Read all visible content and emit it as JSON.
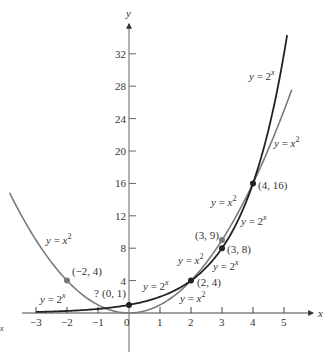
{
  "chart_data": {
    "type": "line",
    "title": "",
    "xlabel": "x",
    "ylabel": "y",
    "xlim": [
      -3.3,
      6.2
    ],
    "ylim": [
      -4,
      37
    ],
    "grid": false,
    "x_ticks": [
      -3,
      -2,
      -1,
      0,
      1,
      2,
      3,
      4,
      5
    ],
    "x_tick_labels": [
      "−3",
      "−2",
      "−1",
      "0",
      "1",
      "2",
      "3",
      "4",
      "5"
    ],
    "y_ticks": [
      4,
      8,
      12,
      16,
      20,
      24,
      28,
      32
    ],
    "y_tick_labels": [
      "4",
      "8",
      "12",
      "16",
      "20",
      "24",
      "28",
      "32"
    ],
    "series": [
      {
        "name": "y = 2^x",
        "label": "y = 2x",
        "function": "2^x",
        "domain": [
          -3,
          5.1
        ],
        "color": "#2a2a2a",
        "x": [
          -3,
          -2,
          -1,
          0,
          1,
          2,
          3,
          4,
          5
        ],
        "values": [
          0.125,
          0.25,
          0.5,
          1,
          2,
          4,
          8,
          16,
          32
        ]
      },
      {
        "name": "y = x^2",
        "label": "y = x2",
        "function": "x^2",
        "domain": [
          -3.85,
          5.25
        ],
        "color": "#7a7a7a",
        "x": [
          -3,
          -2,
          -1,
          0,
          1,
          2,
          3,
          4,
          5
        ],
        "values": [
          9,
          4,
          1,
          0,
          1,
          4,
          9,
          16,
          25
        ]
      }
    ],
    "points": [
      {
        "label": "(−2, 4)",
        "x": -2,
        "y": 4,
        "series": "y = x^2"
      },
      {
        "label": "(0, 1)",
        "x": 0,
        "y": 1,
        "series": "y = 2^x"
      },
      {
        "label": "(2, 4)",
        "x": 2,
        "y": 4,
        "series": "both"
      },
      {
        "label": "(3, 9)",
        "x": 3,
        "y": 9,
        "series": "y = x^2"
      },
      {
        "label": "(3, 8)",
        "x": 3,
        "y": 8,
        "series": "y = 2^x"
      },
      {
        "label": "(4, 16)",
        "x": 4,
        "y": 16,
        "series": "both"
      }
    ],
    "annotations": [
      {
        "text": "y = 2x",
        "near": [
          4.7,
          30
        ]
      },
      {
        "text": "y = x2",
        "near": [
          5.3,
          20.5
        ]
      },
      {
        "text": "y = x2",
        "near": [
          -2.2,
          12
        ]
      },
      {
        "text": "y = 2x",
        "near": [
          -2.7,
          2.5
        ]
      },
      {
        "text": "y = 2x",
        "near": [
          0.8,
          3
        ]
      },
      {
        "text": "y = x2",
        "near": [
          2.4,
          15.5
        ]
      },
      {
        "text": "y = 2x",
        "near": [
          3.3,
          13.5
        ]
      },
      {
        "text": "y = x2",
        "near": [
          1.5,
          9.5
        ]
      },
      {
        "text": "y = 2x",
        "near": [
          2.5,
          7.5
        ]
      },
      {
        "text": "y = x2",
        "near": [
          1.5,
          1.4
        ]
      },
      {
        "text": "?",
        "near": [
          -0.8,
          1.6
        ]
      },
      {
        "text": "x",
        "near": [
          -3.9,
          -1.5
        ]
      }
    ]
  },
  "labels": {
    "x_axis": "x",
    "y_axis": "y",
    "pt_m2_4": "(−2, 4)",
    "pt_0_1": "(0, 1)",
    "pt_2_4": "(2, 4)",
    "pt_3_9": "(3, 9)",
    "pt_3_8": "(3, 8)",
    "pt_4_16": "(4, 16)",
    "question_mark": "?",
    "stray_x": "x",
    "y_eq": "y = ",
    "two": "2",
    "x_sup": "x",
    "x_base": "x",
    "sup2": "2"
  }
}
